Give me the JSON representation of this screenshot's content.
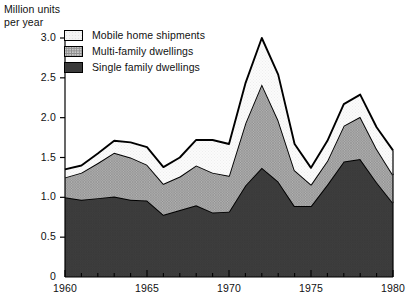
{
  "figure": {
    "y_axis_title_line1": "Million units",
    "y_axis_title_line2": "per year"
  },
  "legend": {
    "items": [
      {
        "label": "Mobile home shipments",
        "swatch": "light",
        "color": "#ececec"
      },
      {
        "label": "Multi-family dwellings",
        "swatch": "medium",
        "color": "#b0b0b0"
      },
      {
        "label": "Single family dwellings",
        "swatch": "dark",
        "color": "#5e5e5e"
      }
    ]
  },
  "chart_data": {
    "type": "area",
    "stacked": true,
    "title": "",
    "xlabel": "",
    "ylabel": "Million units per year",
    "xlim": [
      1960,
      1980
    ],
    "ylim": [
      0,
      3.0
    ],
    "grid": false,
    "legend_position": "top-left-inside",
    "x": [
      1960,
      1961,
      1962,
      1963,
      1964,
      1965,
      1966,
      1967,
      1968,
      1969,
      1970,
      1971,
      1972,
      1973,
      1974,
      1975,
      1976,
      1977,
      1978,
      1979,
      1980
    ],
    "xticks": [
      1960,
      1965,
      1970,
      1975,
      1980
    ],
    "xtick_labels": [
      "1960",
      "1965",
      "1970",
      "1975",
      "1980"
    ],
    "yticks": [
      0,
      0.5,
      1.0,
      1.5,
      2.0,
      2.5,
      3.0
    ],
    "ytick_labels": [
      "0",
      "0.5",
      "1.0",
      "1.5",
      "2.0",
      "2.5",
      "3.0"
    ],
    "series": [
      {
        "name": "Single family dwellings",
        "color": "#5e5e5e",
        "values": [
          1.0,
          0.97,
          0.99,
          1.01,
          0.97,
          0.96,
          0.78,
          0.84,
          0.9,
          0.81,
          0.82,
          1.15,
          1.37,
          1.2,
          0.89,
          0.89,
          1.16,
          1.45,
          1.48,
          1.19,
          0.93
        ]
      },
      {
        "name": "Multi-family dwellings",
        "color": "#b0b0b0",
        "values": [
          0.25,
          0.34,
          0.44,
          0.55,
          0.53,
          0.45,
          0.39,
          0.42,
          0.5,
          0.5,
          0.45,
          0.78,
          1.05,
          0.77,
          0.45,
          0.27,
          0.3,
          0.45,
          0.53,
          0.42,
          0.35
        ]
      },
      {
        "name": "Mobile home shipments",
        "color": "#ececec",
        "values": [
          0.1,
          0.09,
          0.12,
          0.15,
          0.19,
          0.22,
          0.21,
          0.24,
          0.32,
          0.41,
          0.4,
          0.5,
          0.58,
          0.57,
          0.33,
          0.21,
          0.25,
          0.27,
          0.28,
          0.27,
          0.31
        ]
      }
    ],
    "stack_totals": [
      1.35,
      1.4,
      1.55,
      1.71,
      1.69,
      1.63,
      1.38,
      1.5,
      1.72,
      1.72,
      1.67,
      2.43,
      3.0,
      2.54,
      1.67,
      1.37,
      1.71,
      2.17,
      2.29,
      1.88,
      1.59
    ]
  }
}
